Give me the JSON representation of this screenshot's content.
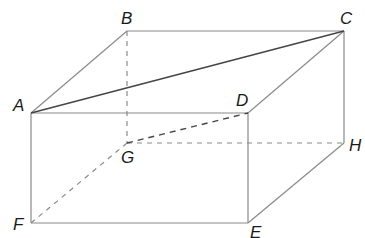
{
  "diagram": {
    "type": "rectangular-prism",
    "stroke_color": "#8a8a8a",
    "diagonal_color": "#444444",
    "vertices": {
      "A": {
        "x": 31,
        "y": 113,
        "label": "A",
        "lx": 13,
        "ly": 111
      },
      "B": {
        "x": 127,
        "y": 31,
        "label": "B",
        "lx": 121,
        "ly": 24
      },
      "C": {
        "x": 344,
        "y": 31,
        "label": "C",
        "lx": 340,
        "ly": 24
      },
      "D": {
        "x": 248,
        "y": 113,
        "label": "D",
        "lx": 236,
        "ly": 106
      },
      "G": {
        "x": 127,
        "y": 143,
        "label": "G",
        "lx": 121,
        "ly": 163
      },
      "H": {
        "x": 344,
        "y": 143,
        "label": "H",
        "lx": 349,
        "ly": 151
      },
      "F": {
        "x": 31,
        "y": 223,
        "label": "F",
        "lx": 13,
        "ly": 230
      },
      "E": {
        "x": 248,
        "y": 223,
        "label": "E",
        "lx": 250,
        "ly": 238
      }
    },
    "solid_edges": [
      [
        "A",
        "B"
      ],
      [
        "B",
        "C"
      ],
      [
        "C",
        "D"
      ],
      [
        "A",
        "D"
      ],
      [
        "C",
        "H"
      ],
      [
        "A",
        "F"
      ],
      [
        "D",
        "E"
      ],
      [
        "F",
        "E"
      ],
      [
        "E",
        "H"
      ]
    ],
    "hidden_edges": [
      [
        "B",
        "G"
      ],
      [
        "G",
        "H"
      ],
      [
        "F",
        "G"
      ]
    ],
    "diagonals": [
      {
        "from": "A",
        "to": "C",
        "style": "solid"
      },
      {
        "from": "G",
        "to": "D",
        "style": "dashed"
      }
    ]
  }
}
